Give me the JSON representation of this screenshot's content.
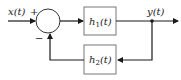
{
  "diagram": {
    "type": "feedback-block-diagram",
    "input_label": "x(t)",
    "output_label": "y(t)",
    "summing_junction": {
      "plus_sign": "+",
      "minus_sign": "−"
    },
    "forward_block": {
      "label_base": "h",
      "label_sub": "1",
      "label_arg": "(t)"
    },
    "feedback_block": {
      "label_base": "h",
      "label_sub": "2",
      "label_arg": "(t)"
    },
    "colors": {
      "line": "#1a1a1a",
      "block_border": "#777777"
    }
  }
}
